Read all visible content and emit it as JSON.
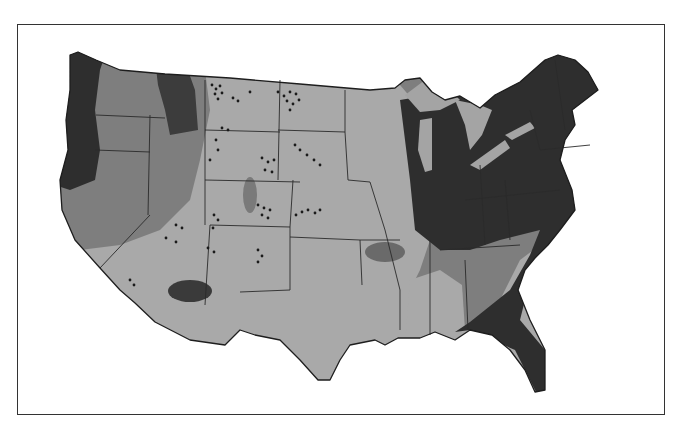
{
  "map": {
    "type": "choropleth",
    "subject": "Continental United States",
    "colors": {
      "background": "#ffffff",
      "frame": "#333333",
      "class_lightest": "#a9a9a9",
      "class_medium": "#7e7e7e",
      "class_dark": "#5f5f5f",
      "class_darkest": "#2e2e2e",
      "lakes": "#a4a4a4",
      "stipple_dots": "#1a1a1a"
    },
    "shading_classes": [
      {
        "name": "lightest",
        "regions": [
          "Great Plains",
          "Southwest",
          "Texas",
          "Lower Mississippi Valley",
          "Coastal California south"
        ]
      },
      {
        "name": "medium",
        "regions": [
          "Great Basin",
          "Northern California interior",
          "Upper Midwest west edge",
          "Tennessee/Kentucky",
          "Georgia/South Carolina interior"
        ]
      },
      {
        "name": "dark",
        "regions": [
          "Northern Rockies (Idaho/Montana west)",
          "Arizona spot",
          "Ozarks spot",
          "Southeast coast band"
        ]
      },
      {
        "name": "darkest",
        "regions": [
          "Pacific Northwest coast",
          "Great Lakes / Ohio Valley",
          "Northeast",
          "Florida",
          "Atlantic coastal strip"
        ]
      }
    ],
    "stipple_areas": [
      "Montana",
      "North Dakota",
      "South Dakota",
      "Wyoming",
      "Nebraska",
      "Colorado",
      "Kansas",
      "Utah",
      "Arizona",
      "New Mexico"
    ],
    "legend": null,
    "title": null
  }
}
